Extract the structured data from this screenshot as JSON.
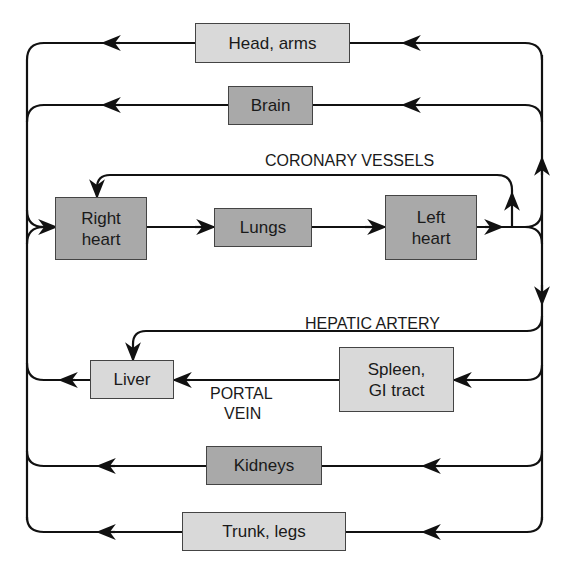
{
  "diagram": {
    "type": "circulation-flow",
    "nodes": {
      "head_arms": "Head, arms",
      "brain": "Brain",
      "right_heart": "Right\nheart",
      "lungs": "Lungs",
      "left_heart": "Left\nheart",
      "liver": "Liver",
      "spleen_gi": "Spleen,\nGI tract",
      "kidneys": "Kidneys",
      "trunk_legs": "Trunk, legs"
    },
    "labels": {
      "coronary": "CORONARY VESSELS",
      "hepatic": "HEPATIC ARTERY",
      "portal_line1": "PORTAL",
      "portal_line2": "VEIN"
    },
    "colors": {
      "light_box": "#d9d9d9",
      "dark_box": "#a9a9a9",
      "line": "#111111"
    },
    "edges": [
      [
        "Right heart",
        "Lungs"
      ],
      [
        "Lungs",
        "Left heart"
      ],
      [
        "Left heart",
        "Head, arms"
      ],
      [
        "Left heart",
        "Brain"
      ],
      [
        "Left heart",
        "Coronary vessels"
      ],
      [
        "Coronary vessels",
        "Right heart"
      ],
      [
        "Left heart",
        "Hepatic artery"
      ],
      [
        "Hepatic artery",
        "Liver"
      ],
      [
        "Left heart",
        "Spleen, GI tract"
      ],
      [
        "Spleen, GI tract",
        "Liver"
      ],
      [
        "Liver",
        "Right heart"
      ],
      [
        "Left heart",
        "Kidneys"
      ],
      [
        "Left heart",
        "Trunk, legs"
      ],
      [
        "Head, arms",
        "Right heart"
      ],
      [
        "Brain",
        "Right heart"
      ],
      [
        "Kidneys",
        "Right heart"
      ],
      [
        "Trunk, legs",
        "Right heart"
      ]
    ]
  }
}
